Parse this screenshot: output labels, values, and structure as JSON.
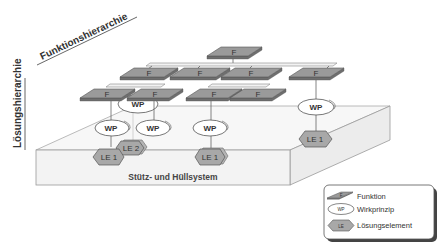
{
  "axes": {
    "function_hierarchy": "Funktionshierarchie",
    "solution_hierarchy": "Lösungshierarchie"
  },
  "base": {
    "label": "Stütz- und Hüllsystem"
  },
  "nodes": {
    "functions": [
      {
        "id": "f-root",
        "label": "F",
        "level": 1
      },
      {
        "id": "f-l2-1",
        "label": "F",
        "level": 2
      },
      {
        "id": "f-l2-2",
        "label": "F",
        "level": 2
      },
      {
        "id": "f-l2-3",
        "label": "F",
        "level": 2
      },
      {
        "id": "f-l2-4",
        "label": "F",
        "level": 2
      },
      {
        "id": "f-l3-1",
        "label": "F",
        "level": 3
      },
      {
        "id": "f-l3-2",
        "label": "F",
        "level": 3
      },
      {
        "id": "f-l3-3",
        "label": "F",
        "level": 3
      },
      {
        "id": "f-l3-4",
        "label": "F",
        "level": 3
      }
    ],
    "working_principles": [
      {
        "id": "wp-hidden",
        "label": "WP"
      },
      {
        "id": "wp-1",
        "label": "WP"
      },
      {
        "id": "wp-2",
        "label": "WP"
      },
      {
        "id": "wp-3",
        "label": "WP"
      },
      {
        "id": "wp-4",
        "label": "WP"
      }
    ],
    "solution_elements": [
      {
        "id": "le-2",
        "label": "LE 2"
      },
      {
        "id": "le-1a",
        "label": "LE 1"
      },
      {
        "id": "le-1b",
        "label": "LE 1"
      },
      {
        "id": "le-1c",
        "label": "LE 1"
      }
    ]
  },
  "legend": {
    "items": [
      {
        "symbol": "F",
        "label": "Funktion"
      },
      {
        "symbol": "WP",
        "label": "Wirkprinzip"
      },
      {
        "symbol": "LE",
        "label": "Lösungselement"
      }
    ]
  }
}
